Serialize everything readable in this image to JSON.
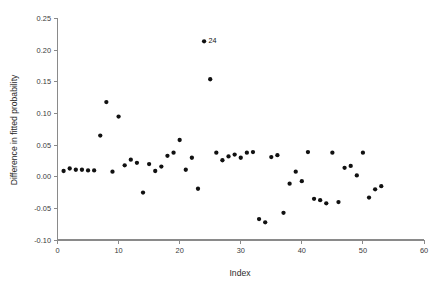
{
  "chart_data": {
    "type": "scatter",
    "title": "",
    "xlabel": "Index",
    "ylabel": "Difference in fitted probability",
    "xlim": [
      0,
      60
    ],
    "ylim": [
      -0.1,
      0.25
    ],
    "xticks": [
      0,
      10,
      20,
      30,
      40,
      50,
      60
    ],
    "xtick_labels": [
      "0",
      "10",
      "20",
      "30",
      "40",
      "50",
      "60"
    ],
    "yticks": [
      -0.1,
      -0.05,
      0.0,
      0.05,
      0.1,
      0.15,
      0.2,
      0.25
    ],
    "ytick_labels": [
      "-0.10",
      "-0.05",
      "0.00",
      "0.05",
      "0.10",
      "0.15",
      "0.20",
      "0.25"
    ],
    "grid": false,
    "legend": false,
    "marker": "filled-circle",
    "marker_color": "#111111",
    "x": [
      1,
      2,
      3,
      4,
      5,
      6,
      7,
      8,
      9,
      10,
      11,
      12,
      13,
      14,
      15,
      16,
      17,
      18,
      19,
      20,
      21,
      22,
      23,
      24,
      25,
      26,
      27,
      28,
      29,
      30,
      31,
      32,
      33,
      34,
      35,
      36,
      37,
      38,
      39,
      40,
      41,
      42,
      43,
      44,
      45,
      46,
      47,
      48,
      49,
      50,
      51,
      52,
      53
    ],
    "y": [
      0.009,
      0.013,
      0.011,
      0.011,
      0.01,
      0.01,
      0.065,
      0.118,
      0.008,
      0.095,
      0.018,
      0.027,
      0.022,
      -0.025,
      0.02,
      0.009,
      0.016,
      0.033,
      0.038,
      0.058,
      0.011,
      0.03,
      -0.019,
      0.214,
      0.154,
      0.038,
      0.026,
      0.032,
      0.035,
      0.03,
      0.038,
      0.039,
      -0.067,
      -0.072,
      0.031,
      0.034,
      -0.057,
      -0.011,
      0.008,
      -0.007,
      0.039,
      -0.035,
      -0.037,
      -0.042,
      0.038,
      -0.04,
      0.014,
      0.017,
      0.002,
      0.038,
      -0.033,
      -0.02,
      -0.015
    ],
    "annotations": [
      {
        "label": "24",
        "x": 24,
        "y": 0.214
      }
    ]
  },
  "axes": {
    "x_title": "Index",
    "y_title": "Difference in fitted probability"
  }
}
